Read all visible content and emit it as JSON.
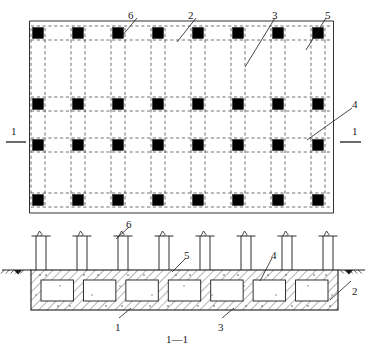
{
  "drawing": {
    "title": "Box foundation structural drawing",
    "section_title": "1—1",
    "section_marker_left": "1",
    "section_marker_right": "1"
  },
  "plan_view": {
    "name": "plan-view",
    "columns_per_row": 8,
    "rows": 4,
    "column_x": [
      38,
      78,
      118,
      158,
      198,
      238,
      278,
      318
    ],
    "row_y": [
      33,
      104,
      145,
      200
    ],
    "column_size": 11,
    "grid_left": 31,
    "grid_right": 330,
    "grid_top": 28,
    "grid_bottom": 206,
    "callouts": [
      {
        "id": "plan-callout-6",
        "text": "6",
        "x": 128,
        "y": 10,
        "lx1": 137,
        "ly1": 18,
        "lx2": 122,
        "ly2": 36
      },
      {
        "id": "plan-callout-2",
        "text": "2",
        "x": 188,
        "y": 10,
        "lx1": 196,
        "ly1": 18,
        "lx2": 177,
        "ly2": 42
      },
      {
        "id": "plan-callout-3",
        "text": "3",
        "x": 272,
        "y": 10,
        "lx1": 275,
        "ly1": 18,
        "lx2": 245,
        "ly2": 67
      },
      {
        "id": "plan-callout-5",
        "text": "5",
        "x": 325,
        "y": 10,
        "lx1": 326,
        "ly1": 18,
        "lx2": 306,
        "ly2": 50
      },
      {
        "id": "plan-callout-4",
        "text": "4",
        "x": 352,
        "y": 99,
        "lx1": 352,
        "ly1": 108,
        "lx2": 307,
        "ly2": 140
      }
    ]
  },
  "section_view": {
    "name": "section-view",
    "title": "1—1",
    "body_left": 31,
    "body_right": 338,
    "body_top": 270,
    "body_bottom": 310,
    "slab_top_thickness": 10,
    "slab_bottom_thickness": 9,
    "void_count": 7,
    "column_count": 8,
    "column_top_y": 232,
    "callouts": [
      {
        "id": "section-callout-6",
        "text": "6",
        "x": 126,
        "y": 219,
        "lx1": 129,
        "ly1": 227,
        "lx2": 116,
        "ly2": 239
      },
      {
        "id": "section-callout-5",
        "text": "5",
        "x": 184,
        "y": 250,
        "lx1": 186,
        "ly1": 258,
        "lx2": 172,
        "ly2": 272
      },
      {
        "id": "section-callout-4",
        "text": "4",
        "x": 271,
        "y": 250,
        "lx1": 272,
        "ly1": 258,
        "lx2": 260,
        "ly2": 281
      },
      {
        "id": "section-callout-2",
        "text": "2",
        "x": 352,
        "y": 286,
        "lx1": 351,
        "ly1": 281,
        "lx2": 330,
        "ly2": 300
      },
      {
        "id": "section-callout-1",
        "text": "1",
        "x": 115,
        "y": 322,
        "lx1": 119,
        "ly1": 318,
        "lx2": 131,
        "ly2": 308
      },
      {
        "id": "section-callout-3",
        "text": "3",
        "x": 218,
        "y": 322,
        "lx1": 222,
        "ly1": 318,
        "lx2": 234,
        "ly2": 308
      }
    ]
  },
  "colors": {
    "line": "#1a1a1a",
    "column_fill": "#000000",
    "dashed": "#333333",
    "background": "#ffffff"
  }
}
